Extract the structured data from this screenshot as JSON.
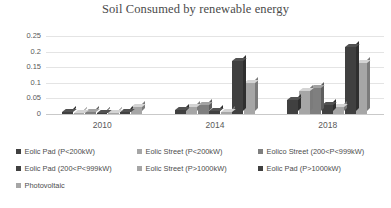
{
  "chart_data": {
    "type": "bar",
    "title": "Soil Consumed by renewable energy",
    "xlabel": "",
    "ylabel": "",
    "categories": [
      "2010",
      "2014",
      "2018"
    ],
    "ylim": [
      0,
      0.25
    ],
    "ytick_labels": [
      "0",
      "0.05",
      "0.1",
      "0.15",
      "0.2",
      "0.25"
    ],
    "ytick_values": [
      0,
      0.05,
      0.1,
      0.15,
      0.2,
      0.25
    ],
    "grid": true,
    "legend_position": "bottom",
    "series": [
      {
        "name": "Eolic Pad (P<200kW)",
        "color": "#404040",
        "values": [
          0.005,
          0.012,
          0.045
        ]
      },
      {
        "name": "Eolic Street  (P<200kW)",
        "color": "#a6a6a6",
        "values": [
          0.004,
          0.022,
          0.075
        ]
      },
      {
        "name": "Eolico Street (200<P<999kW)",
        "color": "#7f7f7f",
        "values": [
          0.006,
          0.028,
          0.082
        ]
      },
      {
        "name": "Eolic Pad (200<P<999kW)",
        "color": "#404040",
        "values": [
          0.004,
          0.01,
          0.03
        ]
      },
      {
        "name": "Eolic Street (P>1000kW)",
        "color": "#a6a6a6",
        "values": [
          0.004,
          0.008,
          0.022
        ]
      },
      {
        "name": "Eolic Pad (P>1000kW)",
        "color": "#404040",
        "values": [
          0.005,
          0.17,
          0.215
        ]
      },
      {
        "name": "Photovoltaic",
        "color": "#a6a6a6",
        "values": [
          0.021,
          0.1,
          0.165
        ]
      }
    ]
  },
  "legend": {
    "rows": [
      [
        {
          "label": "Eolic Pad (P<200kW)",
          "color": "#404040"
        },
        {
          "label": "Eolic Street  (P<200kW)",
          "color": "#a6a6a6"
        },
        {
          "label": "Eolico Street (200<P<999kW)",
          "color": "#7f7f7f"
        }
      ],
      [
        {
          "label": "Eolic Pad (200<P<999kW)",
          "color": "#404040"
        },
        {
          "label": "Eolic Street (P>1000kW)",
          "color": "#a6a6a6"
        },
        {
          "label": "Eolic Pad (P>1000kW)",
          "color": "#404040"
        }
      ],
      [
        {
          "label": "Photovoltaic",
          "color": "#a6a6a6"
        }
      ]
    ]
  }
}
